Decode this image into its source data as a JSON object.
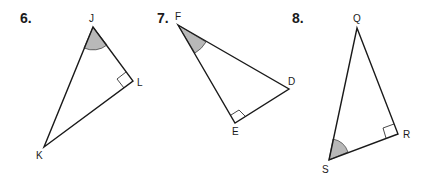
{
  "problems": [
    {
      "number": "6.",
      "vertices": {
        "J": [
          93,
          27
        ],
        "L": [
          133,
          81
        ],
        "K": [
          44,
          147
        ]
      },
      "labels": [
        "J",
        "L",
        "K"
      ],
      "right_angle_at": "L",
      "marked_angle_at": "J"
    },
    {
      "number": "7.",
      "vertices": {
        "F": [
          178,
          25
        ],
        "D": [
          289,
          89
        ],
        "E": [
          235,
          123
        ]
      },
      "labels": [
        "F",
        "D",
        "E"
      ],
      "right_angle_at": "E",
      "marked_angle_at": "F"
    },
    {
      "number": "8.",
      "vertices": {
        "Q": [
          357,
          28
        ],
        "R": [
          398,
          134
        ],
        "S": [
          329,
          160
        ]
      },
      "labels": [
        "Q",
        "R",
        "S"
      ],
      "right_angle_at": "R",
      "marked_angle_at": "S"
    }
  ],
  "colors": {
    "line": "#1a1a1a",
    "angle_fill": "#b8b8b8",
    "background": "#ffffff"
  }
}
